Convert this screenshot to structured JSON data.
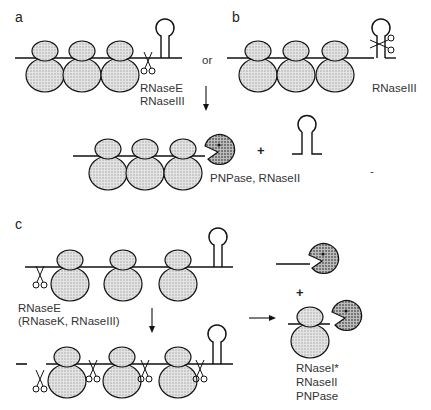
{
  "figure": {
    "panels": {
      "a": {
        "label": "a",
        "connector": "or",
        "enzymes": [
          "RNaseE",
          "RNaseIII"
        ]
      },
      "b": {
        "label": "b",
        "enzymes": [
          "RNaseIII"
        ]
      },
      "ab_product": {
        "enzymes": "PNPase, RNaseII",
        "plus": "+",
        "mark": "-"
      },
      "c": {
        "label": "c",
        "initial_enzymes": [
          "RNaseE",
          "(RNaseK, RNaseIII)"
        ],
        "plus": "+",
        "final_enzymes": [
          "RNaseI*",
          "RNaseII",
          "PNPase"
        ]
      }
    },
    "colors": {
      "line": "#111111",
      "ribosome_fill": "#dcdcdc",
      "exonuclease_fill": "#a9a9a9"
    }
  }
}
